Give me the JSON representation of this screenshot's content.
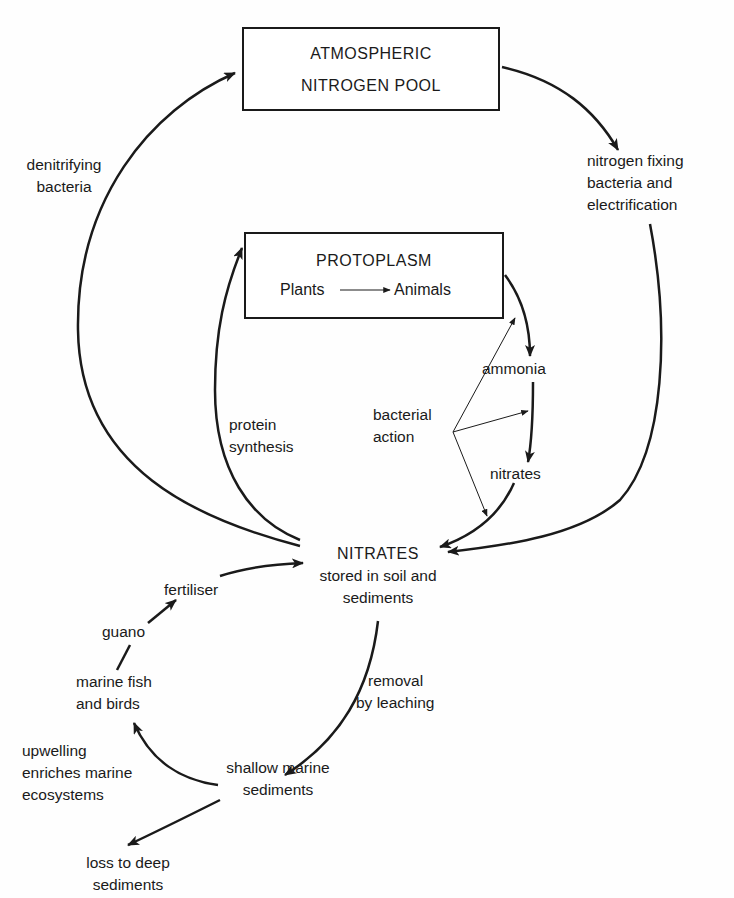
{
  "diagram": {
    "nodes": {
      "atmospheric": {
        "line1": "ATMOSPHERIC",
        "line2": "NITROGEN POOL"
      },
      "protoplasm": {
        "title": "PROTOPLASM",
        "from": "Plants",
        "to": "Animals"
      },
      "nitrates_main": {
        "title": "NITRATES",
        "line1": "stored in soil and",
        "line2": "sediments"
      },
      "ammonia": "ammonia",
      "nitrates_small": "nitrates",
      "shallow": {
        "line1": "shallow marine",
        "line2": "sediments"
      },
      "fish": {
        "line1": "marine fish",
        "line2": "and birds"
      },
      "guano": "guano",
      "fertiliser": "fertiliser",
      "loss": {
        "line1": "loss to deep",
        "line2": "sediments"
      }
    },
    "edge_labels": {
      "denitrifying": {
        "line1": "denitrifying",
        "line2": "bacteria"
      },
      "fixing": {
        "line1": "nitrogen fixing",
        "line2": "bacteria and",
        "line3": "electrification"
      },
      "protein": {
        "line1": "protein",
        "line2": "synthesis"
      },
      "bacterial": {
        "line1": "bacterial",
        "line2": "action"
      },
      "leaching": {
        "line1": "removal",
        "line2": "by leaching"
      },
      "upwelling": {
        "line1": "upwelling",
        "line2": "enriches marine",
        "line3": "ecosystems"
      }
    }
  }
}
